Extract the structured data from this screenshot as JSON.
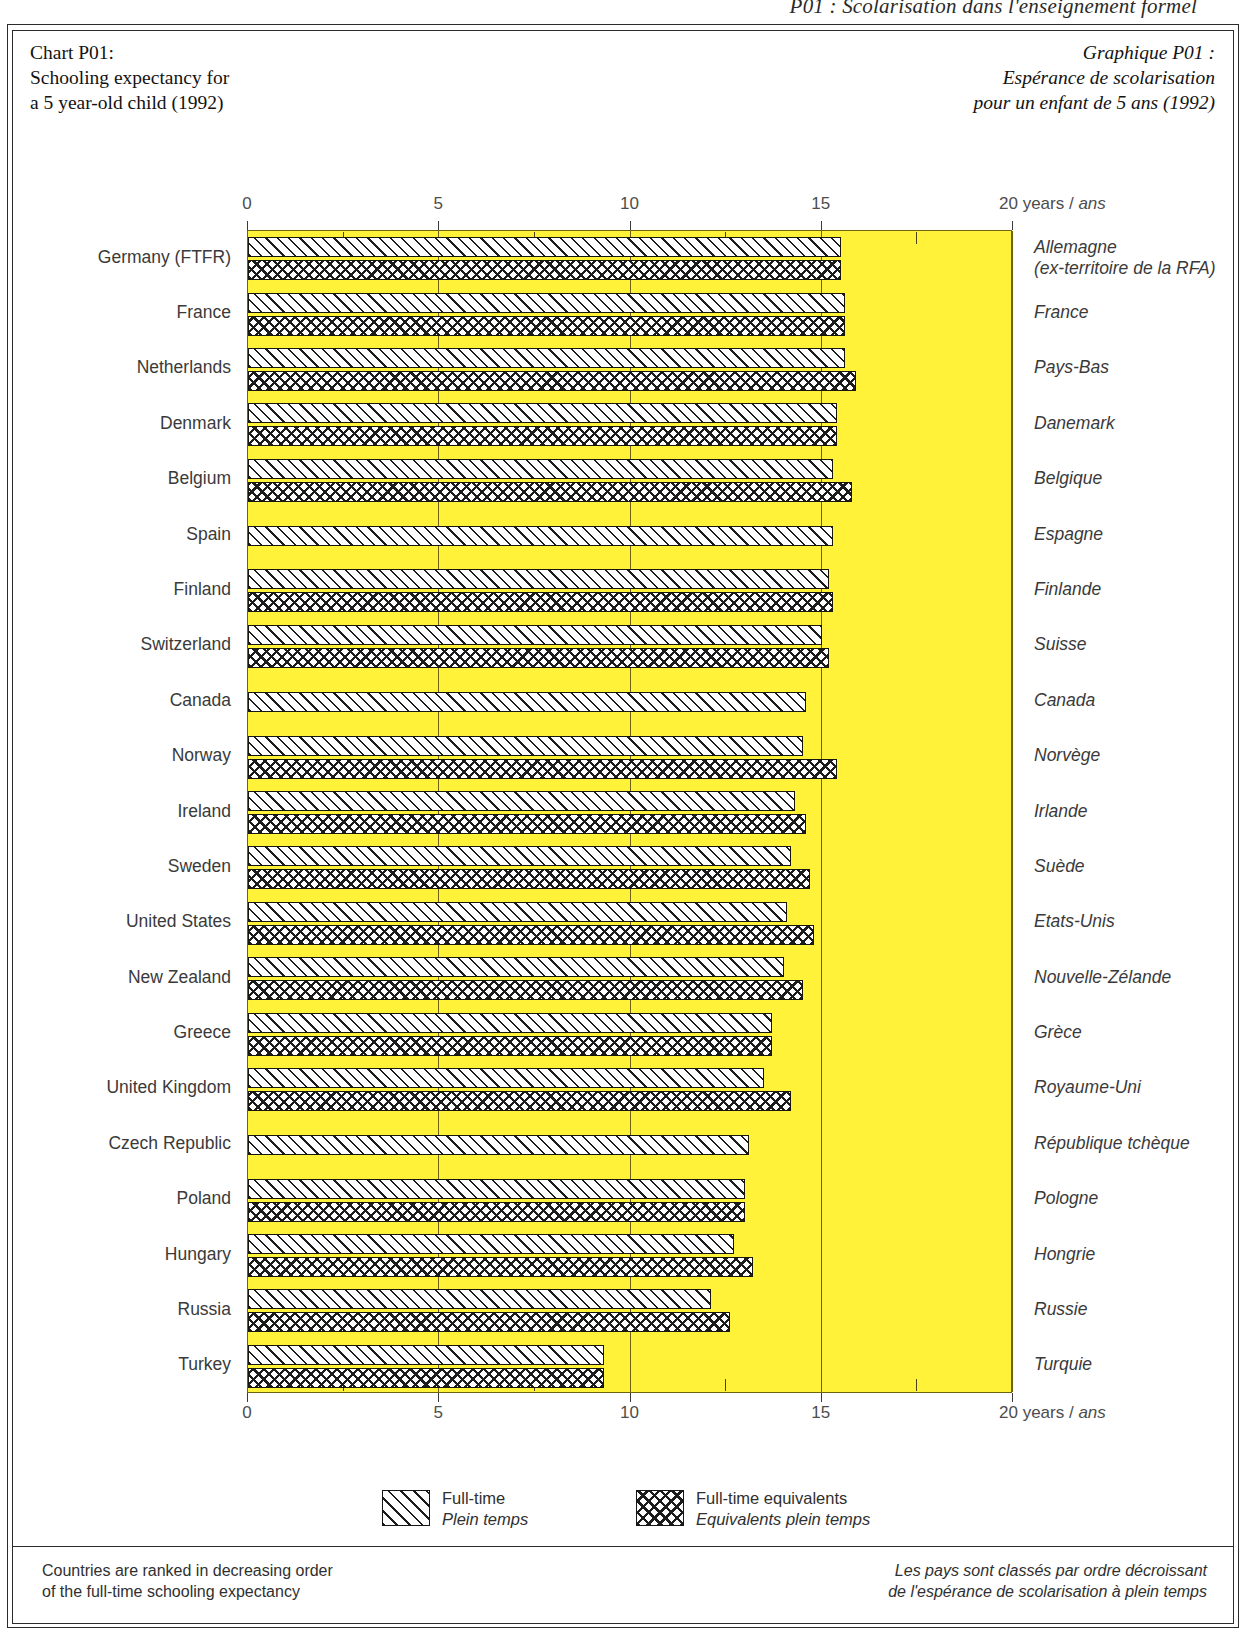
{
  "running_head": "P01 : Scolarisation dans l'enseignement formel",
  "title_en": [
    "Chart P01:",
    "Schooling expectancy for",
    "a 5 year-old child (1992)"
  ],
  "title_fr": [
    "Graphique P01 :",
    "Espérance de scolarisation",
    "pour un enfant de 5 ans (1992)"
  ],
  "axis": {
    "ticks": [
      "0",
      "5",
      "10",
      "15"
    ],
    "last_tick_en": "20 years / ",
    "last_tick_fr": "ans"
  },
  "legend": [
    {
      "en": "Full-time",
      "fr": "Plein temps",
      "pattern": "diagonal-hatch"
    },
    {
      "en": "Full-time equivalents",
      "fr": "Equivalents plein temps",
      "pattern": "cross-hatch"
    }
  ],
  "footnote_en": [
    "Countries are ranked in decreasing order",
    "of the full-time schooling expectancy"
  ],
  "footnote_fr": [
    "Les pays sont classés par ordre décroissant",
    "de l'espérance de scolarisation à plein temps"
  ],
  "chart_data": {
    "type": "bar",
    "orientation": "horizontal",
    "title": "Schooling expectancy for a 5 year-old child (1992)",
    "title_fr": "Espérance de scolarisation pour un enfant de 5 ans (1992)",
    "xlabel": "20 years / ans",
    "ylabel": "",
    "xlim": [
      0,
      20
    ],
    "xticks": [
      0,
      5,
      10,
      15,
      20
    ],
    "grid": true,
    "legend_position": "bottom",
    "series": [
      {
        "name": "Full-time",
        "name_fr": "Plein temps"
      },
      {
        "name": "Full-time equivalents",
        "name_fr": "Equivalents plein temps"
      }
    ],
    "categories": [
      "Germany (FTFR)",
      "France",
      "Netherlands",
      "Denmark",
      "Belgium",
      "Spain",
      "Finland",
      "Switzerland",
      "Canada",
      "Norway",
      "Ireland",
      "Sweden",
      "United States",
      "New Zealand",
      "Greece",
      "United Kingdom",
      "Czech Republic",
      "Poland",
      "Hungary",
      "Russia",
      "Turkey"
    ],
    "categories_fr": [
      "Allemagne\n(ex-territoire de la RFA)",
      "France",
      "Pays-Bas",
      "Danemark",
      "Belgique",
      "Espagne",
      "Finlande",
      "Suisse",
      "Canada",
      "Norvège",
      "Irlande",
      "Suède",
      "Etats-Unis",
      "Nouvelle-Zélande",
      "Grèce",
      "Royaume-Uni",
      "République tchèque",
      "Pologne",
      "Hongrie",
      "Russie",
      "Turquie"
    ],
    "rows": [
      {
        "label_en": "Germany (FTFR)",
        "label_fr_line1": "Allemagne",
        "label_fr_line2": "(ex-territoire de la RFA)",
        "full_time": 15.5,
        "fte": 15.5
      },
      {
        "label_en": "France",
        "label_fr_line1": "France",
        "label_fr_line2": "",
        "full_time": 15.6,
        "fte": 15.6
      },
      {
        "label_en": "Netherlands",
        "label_fr_line1": "Pays-Bas",
        "label_fr_line2": "",
        "full_time": 15.6,
        "fte": 15.9
      },
      {
        "label_en": "Denmark",
        "label_fr_line1": "Danemark",
        "label_fr_line2": "",
        "full_time": 15.4,
        "fte": 15.4
      },
      {
        "label_en": "Belgium",
        "label_fr_line1": "Belgique",
        "label_fr_line2": "",
        "full_time": 15.3,
        "fte": 15.8
      },
      {
        "label_en": "Spain",
        "label_fr_line1": "Espagne",
        "label_fr_line2": "",
        "full_time": 15.3,
        "fte": null
      },
      {
        "label_en": "Finland",
        "label_fr_line1": "Finlande",
        "label_fr_line2": "",
        "full_time": 15.2,
        "fte": 15.3
      },
      {
        "label_en": "Switzerland",
        "label_fr_line1": "Suisse",
        "label_fr_line2": "",
        "full_time": 15.0,
        "fte": 15.2
      },
      {
        "label_en": "Canada",
        "label_fr_line1": "Canada",
        "label_fr_line2": "",
        "full_time": 14.6,
        "fte": null
      },
      {
        "label_en": "Norway",
        "label_fr_line1": "Norvège",
        "label_fr_line2": "",
        "full_time": 14.5,
        "fte": 15.4
      },
      {
        "label_en": "Ireland",
        "label_fr_line1": "Irlande",
        "label_fr_line2": "",
        "full_time": 14.3,
        "fte": 14.6
      },
      {
        "label_en": "Sweden",
        "label_fr_line1": "Suède",
        "label_fr_line2": "",
        "full_time": 14.2,
        "fte": 14.7
      },
      {
        "label_en": "United States",
        "label_fr_line1": "Etats-Unis",
        "label_fr_line2": "",
        "full_time": 14.1,
        "fte": 14.8
      },
      {
        "label_en": "New Zealand",
        "label_fr_line1": "Nouvelle-Zélande",
        "label_fr_line2": "",
        "full_time": 14.0,
        "fte": 14.5
      },
      {
        "label_en": "Greece",
        "label_fr_line1": "Grèce",
        "label_fr_line2": "",
        "full_time": 13.7,
        "fte": 13.7
      },
      {
        "label_en": "United Kingdom",
        "label_fr_line1": "Royaume-Uni",
        "label_fr_line2": "",
        "full_time": 13.5,
        "fte": 14.2
      },
      {
        "label_en": "Czech Republic",
        "label_fr_line1": "République tchèque",
        "label_fr_line2": "",
        "full_time": 13.1,
        "fte": null
      },
      {
        "label_en": "Poland",
        "label_fr_line1": "Pologne",
        "label_fr_line2": "",
        "full_time": 13.0,
        "fte": 13.0
      },
      {
        "label_en": "Hungary",
        "label_fr_line1": "Hongrie",
        "label_fr_line2": "",
        "full_time": 12.7,
        "fte": 13.2
      },
      {
        "label_en": "Russia",
        "label_fr_line1": "Russie",
        "label_fr_line2": "",
        "full_time": 12.1,
        "fte": 12.6
      },
      {
        "label_en": "Turkey",
        "label_fr_line1": "Turquie",
        "label_fr_line2": "",
        "full_time": 9.3,
        "fte": 9.3
      }
    ]
  }
}
